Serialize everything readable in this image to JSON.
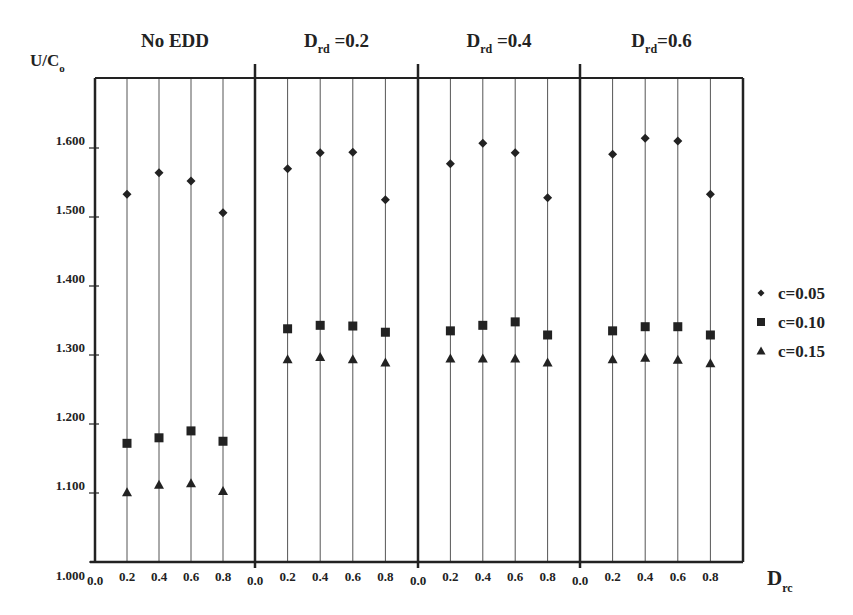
{
  "chart_data": {
    "type": "scatter",
    "title": "",
    "ylabel": "U/C",
    "ylabel_sub": "o",
    "xlabel": "D",
    "xlabel_sub": "rc",
    "ylim": [
      1.0,
      1.7
    ],
    "y_ticks": [
      "1.000",
      "1.100",
      "1.200",
      "1.300",
      "1.400",
      "1.500",
      "1.600"
    ],
    "x_ticks": [
      "0.0",
      "0.2",
      "0.4",
      "0.6",
      "0.8"
    ],
    "x": [
      0.2,
      0.4,
      0.6,
      0.8
    ],
    "grid": "vertical lines at each x tick",
    "legend_position": "right",
    "panels": [
      {
        "title": "No EDD",
        "title_main": "No EDD",
        "title_sub": "",
        "title_suffix": "",
        "series": [
          {
            "name": "c=0.05",
            "marker": "diamond",
            "values": [
              1.533,
              1.564,
              1.552,
              1.506
            ]
          },
          {
            "name": "c=0.10",
            "marker": "square",
            "values": [
              1.172,
              1.18,
              1.19,
              1.175
            ]
          },
          {
            "name": "c=0.15",
            "marker": "triangle",
            "values": [
              1.101,
              1.112,
              1.114,
              1.103
            ]
          }
        ]
      },
      {
        "title": "Drd =0.2",
        "title_main": "D",
        "title_sub": "rd",
        "title_suffix": " =0.2",
        "series": [
          {
            "name": "c=0.05",
            "marker": "diamond",
            "values": [
              1.57,
              1.593,
              1.594,
              1.525
            ]
          },
          {
            "name": "c=0.10",
            "marker": "square",
            "values": [
              1.338,
              1.343,
              1.342,
              1.333
            ]
          },
          {
            "name": "c=0.15",
            "marker": "triangle",
            "values": [
              1.294,
              1.297,
              1.294,
              1.289
            ]
          }
        ]
      },
      {
        "title": "Drd =0.4",
        "title_main": "D",
        "title_sub": "rd",
        "title_suffix": " =0.4",
        "series": [
          {
            "name": "c=0.05",
            "marker": "diamond",
            "values": [
              1.577,
              1.607,
              1.593,
              1.528
            ]
          },
          {
            "name": "c=0.10",
            "marker": "square",
            "values": [
              1.335,
              1.343,
              1.348,
              1.329
            ]
          },
          {
            "name": "c=0.15",
            "marker": "triangle",
            "values": [
              1.295,
              1.295,
              1.295,
              1.289
            ]
          }
        ]
      },
      {
        "title": "Drd =0.6",
        "title_main": "D",
        "title_sub": "rd",
        "title_suffix": "=0.6",
        "series": [
          {
            "name": "c=0.05",
            "marker": "diamond",
            "values": [
              1.591,
              1.614,
              1.61,
              1.533
            ]
          },
          {
            "name": "c=0.10",
            "marker": "square",
            "values": [
              1.335,
              1.341,
              1.341,
              1.329
            ]
          },
          {
            "name": "c=0.15",
            "marker": "triangle",
            "values": [
              1.294,
              1.296,
              1.293,
              1.288
            ]
          }
        ]
      }
    ],
    "legend": [
      {
        "label": "c=0.05",
        "marker": "diamond"
      },
      {
        "label": "c=0.10",
        "marker": "square"
      },
      {
        "label": "c=0.15",
        "marker": "triangle"
      }
    ]
  },
  "colors": {
    "ink": "#222222",
    "grid": "#555555",
    "background": "#ffffff"
  }
}
